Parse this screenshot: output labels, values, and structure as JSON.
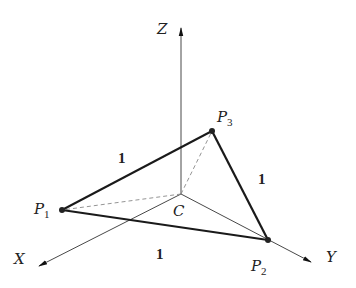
{
  "diagram": {
    "type": "3d-coordinate-triangle",
    "origin": {
      "label": "C",
      "x": 181,
      "y": 194,
      "label_x": 173,
      "label_y": 216
    },
    "axes": [
      {
        "name": "X",
        "tip": [
          38,
          267
        ],
        "label_x": 14,
        "label_y": 264
      },
      {
        "name": "Y",
        "tip": [
          312,
          263
        ],
        "label_x": 326,
        "label_y": 262
      },
      {
        "name": "Z",
        "tip": [
          181,
          27
        ],
        "label_x": 157,
        "label_y": 34
      }
    ],
    "points": [
      {
        "id": "P1",
        "base": "P",
        "sub": "1",
        "x": 62,
        "y": 210,
        "label_x": 34,
        "label_y": 214
      },
      {
        "id": "P2",
        "base": "P",
        "sub": "2",
        "x": 268,
        "y": 240,
        "label_x": 251,
        "label_y": 271
      },
      {
        "id": "P3",
        "base": "P",
        "sub": "3",
        "x": 212,
        "y": 131,
        "label_x": 217,
        "label_y": 122
      }
    ],
    "edges": [
      {
        "from": "P1",
        "to": "P3",
        "length_label": "1",
        "label_x": 118,
        "label_y": 163
      },
      {
        "from": "P3",
        "to": "P2",
        "length_label": "1",
        "label_x": 258,
        "label_y": 184
      },
      {
        "from": "P1",
        "to": "P2",
        "length_label": "1",
        "label_x": 156,
        "label_y": 259
      }
    ],
    "dashed_edges": [
      {
        "from": "C",
        "to": "P1"
      },
      {
        "from": "C",
        "to": "P3"
      }
    ],
    "solid_thin_edges": [
      {
        "from": "C",
        "to": "P2"
      }
    ],
    "colors": {
      "stroke": "#1a1a1a",
      "thin": "#444444",
      "dashed": "#888888"
    }
  }
}
